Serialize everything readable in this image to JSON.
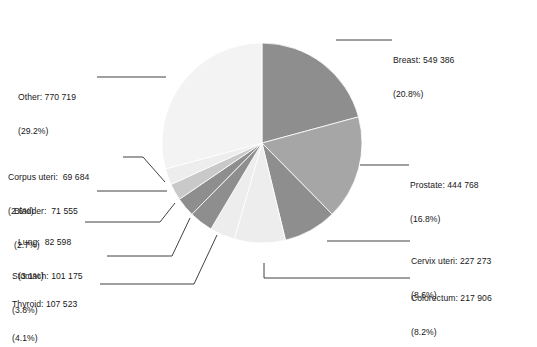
{
  "chart_data": {
    "type": "pie",
    "title": "",
    "subtitle": "",
    "xlabel": "",
    "ylabel": "",
    "legend_position": "callout-labels",
    "grid": false,
    "start_angle_deg": 0,
    "direction": "clockwise",
    "total": 2642587,
    "categories": [
      "Breast",
      "Prostate",
      "Cervix uteri",
      "Colorectum",
      "Thyroid",
      "Stomach",
      "Lung",
      "Bladder",
      "Corpus uteri",
      "Other"
    ],
    "values": [
      549386,
      444768,
      227273,
      217906,
      107523,
      101175,
      82598,
      71555,
      69684,
      770719
    ],
    "percentages": [
      20.8,
      16.8,
      8.6,
      8.2,
      4.1,
      3.8,
      3.1,
      2.7,
      2.6,
      29.2
    ],
    "colors": [
      "#8e8e8e",
      "#a6a6a6",
      "#8e8e8e",
      "#ededed",
      "#ededed",
      "#8e8e8e",
      "#8e8e8e",
      "#c9c9c9",
      "#ededed",
      "#f3f3f3"
    ]
  },
  "slices": [
    {
      "name": "breast",
      "label_line1": "Breast: 549 386",
      "label_line2": "(20.8%)",
      "category": "Breast",
      "value": "549 386",
      "percent": "20.8%",
      "color": "#8e8e8e"
    },
    {
      "name": "prostate",
      "label_line1": "Prostate: 444 768",
      "label_line2": "(16.8%)",
      "category": "Prostate",
      "value": "444 768",
      "percent": "16.8%",
      "color": "#a6a6a6"
    },
    {
      "name": "cervix-uteri",
      "label_line1": "Cervix uteri: 227 273",
      "label_line2": "(8.6%)",
      "category": "Cervix uteri",
      "value": "227 273",
      "percent": "8.6%",
      "color": "#8e8e8e"
    },
    {
      "name": "colorectum",
      "label_line1": "Colorectum: 217 906",
      "label_line2": "(8.2%)",
      "category": "Colorectum",
      "value": "217 906",
      "percent": "8.2%",
      "color": "#ededed"
    },
    {
      "name": "thyroid",
      "label_line1": "Thyroid: 107 523",
      "label_line2": "(4.1%)",
      "category": "Thyroid",
      "value": "107 523",
      "percent": "4.1%",
      "color": "#ededed"
    },
    {
      "name": "stomach",
      "label_line1": "Stomach: 101 175",
      "label_line2": "(3.8%)",
      "category": "Stomach",
      "value": "101 175",
      "percent": "3.8%",
      "color": "#8e8e8e"
    },
    {
      "name": "lung",
      "label_line1": "Lung:  82 598",
      "label_line2": "(3.1%)",
      "category": "Lung",
      "value": "82 598",
      "percent": "3.1%",
      "color": "#8e8e8e"
    },
    {
      "name": "bladder",
      "label_line1": "Bladder:  71 555",
      "label_line2": "(2.7%)",
      "category": "Bladder",
      "value": "71 555",
      "percent": "2.7%",
      "color": "#c9c9c9"
    },
    {
      "name": "corpus-uteri",
      "label_line1": "Corpus uteri:  69 684",
      "label_line2": "(2.6%)",
      "category": "Corpus uteri",
      "value": "69 684",
      "percent": "2.6%",
      "color": "#ededed"
    },
    {
      "name": "other",
      "label_line1": "Other: 770 719",
      "label_line2": "(29.2%)",
      "category": "Other",
      "value": "770 719",
      "percent": "29.2%",
      "color": "#f3f3f3"
    }
  ],
  "style": {
    "background": "#ffffff",
    "leader_line_color": "#2b2b2b",
    "slice_edge_color": "#ffffff",
    "text_color": "#171717"
  }
}
